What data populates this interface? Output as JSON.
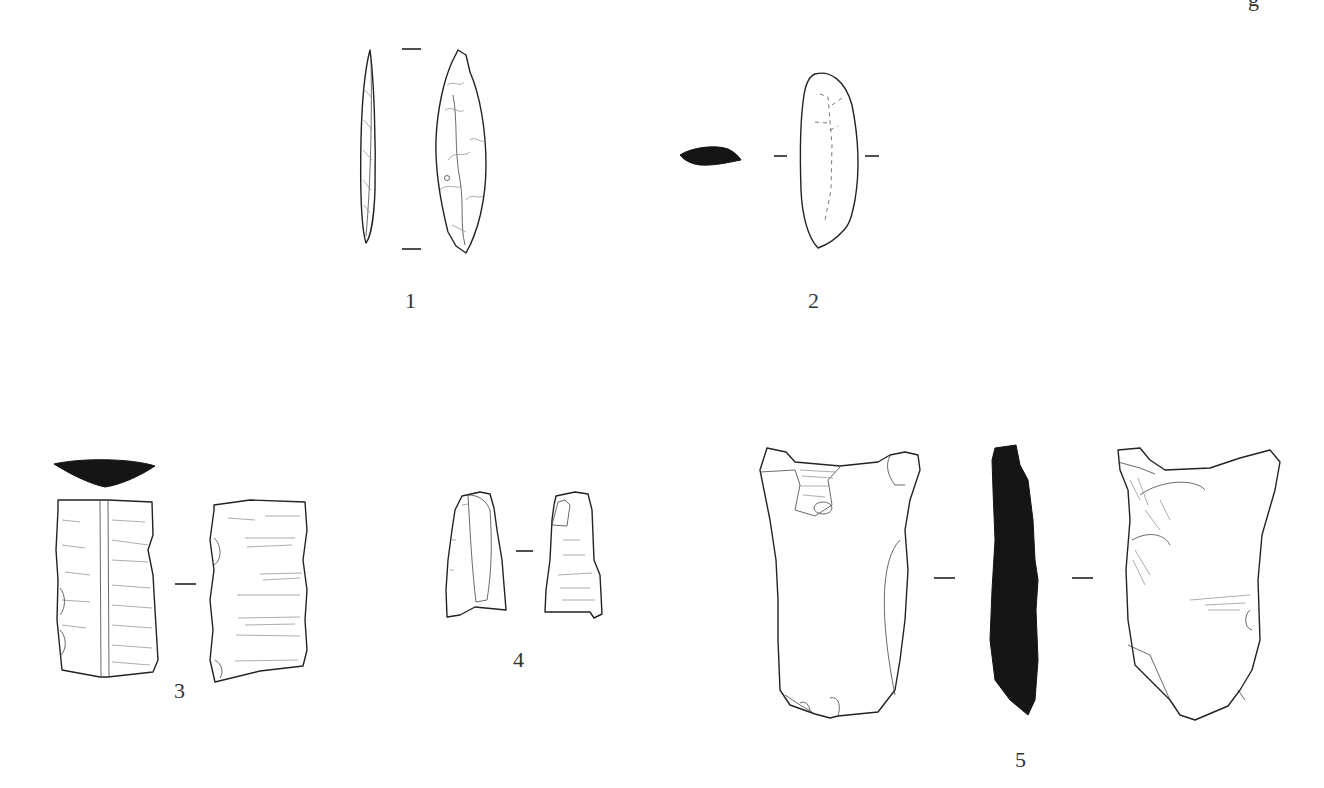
{
  "figure": {
    "header_fragment": "g",
    "artifacts": [
      {
        "id": 1,
        "label": "1",
        "views": [
          "profile",
          "dorsal"
        ],
        "description": "bifacial leaf-shaped point"
      },
      {
        "id": 2,
        "label": "2",
        "views": [
          "cross-section",
          "dorsal"
        ],
        "description": "elongated flake"
      },
      {
        "id": 3,
        "label": "3",
        "views": [
          "cross-section",
          "dorsal",
          "ventral"
        ],
        "description": "blade segment"
      },
      {
        "id": 4,
        "label": "4",
        "views": [
          "dorsal",
          "ventral"
        ],
        "description": "small blade fragment"
      },
      {
        "id": 5,
        "label": "5",
        "views": [
          "dorsal",
          "profile-section",
          "ventral"
        ],
        "description": "large flake"
      }
    ]
  }
}
